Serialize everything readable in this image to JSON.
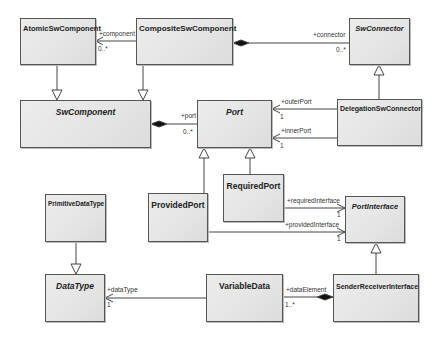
{
  "diagram": {
    "type": "UML class diagram",
    "classes": {
      "atomic_sw_component": {
        "name": "AtomicSwComponent",
        "abstract": false
      },
      "composite_sw_component": {
        "name": "CompositeSwComponent",
        "abstract": false
      },
      "sw_connector": {
        "name": "SwConnector",
        "abstract": true
      },
      "sw_component": {
        "name": "SwComponent",
        "abstract": true
      },
      "port": {
        "name": "Port",
        "abstract": true
      },
      "delegation_sw_connector": {
        "name": "DelegationSwConnector",
        "abstract": false
      },
      "required_port": {
        "name": "RequiredPort",
        "abstract": false
      },
      "provided_port": {
        "name": "ProvidedPort",
        "abstract": false
      },
      "port_interface": {
        "name": "PortInterface",
        "abstract": true
      },
      "primitive_data_type": {
        "name": "PrimitiveDataType",
        "abstract": false
      },
      "data_type": {
        "name": "DataType",
        "abstract": true
      },
      "variable_data": {
        "name": "VariableData",
        "abstract": false
      },
      "sender_receiver_interface": {
        "name": "SenderReceiverInterface",
        "abstract": false
      }
    },
    "associations": {
      "component": {
        "from": "CompositeSwComponent",
        "to": "AtomicSwComponent",
        "role": "+component",
        "multiplicity": "0..*"
      },
      "connector": {
        "from": "CompositeSwComponent",
        "to": "SwConnector",
        "kind": "composition",
        "role": "+connector",
        "multiplicity": "0..*"
      },
      "port": {
        "from": "SwComponent",
        "to": "Port",
        "kind": "composition",
        "role": "+port",
        "multiplicity": "0..*"
      },
      "outer_port": {
        "from": "DelegationSwConnector",
        "to": "Port",
        "role": "+outerPort",
        "multiplicity": "1"
      },
      "inner_port": {
        "from": "DelegationSwConnector",
        "to": "Port",
        "role": "+innerPort",
        "multiplicity": "1"
      },
      "required_interface": {
        "from": "RequiredPort",
        "to": "PortInterface",
        "role": "+requiredInterface",
        "multiplicity": "1"
      },
      "provided_interface": {
        "from": "ProvidedPort",
        "to": "PortInterface",
        "role": "+providedInterface",
        "multiplicity": "1"
      },
      "data_type": {
        "from": "VariableData",
        "to": "DataType",
        "role": "+dataType",
        "multiplicity": "1"
      },
      "data_element": {
        "from": "SenderReceiverInterface",
        "to": "VariableData",
        "kind": "composition",
        "role": "+dataElement",
        "multiplicity": "1..*"
      }
    },
    "generalizations": [
      {
        "child": "AtomicSwComponent",
        "parent": "SwComponent"
      },
      {
        "child": "CompositeSwComponent",
        "parent": "SwComponent"
      },
      {
        "child": "DelegationSwConnector",
        "parent": "SwConnector"
      },
      {
        "child": "ProvidedPort",
        "parent": "Port"
      },
      {
        "child": "RequiredPort",
        "parent": "Port"
      },
      {
        "child": "SenderReceiverInterface",
        "parent": "PortInterface"
      },
      {
        "child": "PrimitiveDataType",
        "parent": "DataType"
      }
    ],
    "colors": {
      "box_fill": "#e6e6e6",
      "box_border": "#555555",
      "line": "#444444",
      "text": "#222222"
    }
  }
}
